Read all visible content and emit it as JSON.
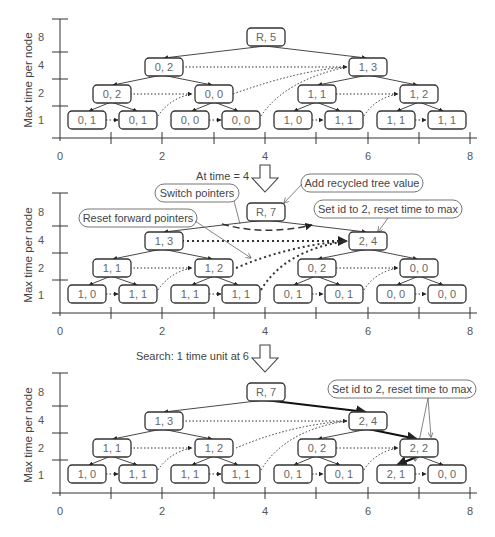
{
  "panels": [
    {
      "id": "panel-1",
      "axis": {
        "ylabel": "Max time per node",
        "yticks": [
          "1",
          "2",
          "4",
          "8"
        ],
        "xticks": [
          "0",
          "2",
          "4",
          "6",
          "8"
        ]
      },
      "nodes": {
        "root": "R, 5",
        "l2": [
          "0, 2",
          "1, 3"
        ],
        "l1": [
          "0, 2",
          "0, 0",
          "1, 1",
          "1, 2"
        ],
        "l0": [
          "0, 1",
          "0, 1",
          "0, 0",
          "0, 0",
          "1, 0",
          "1, 1",
          "1, 1",
          "1, 1"
        ]
      }
    },
    {
      "id": "panel-2",
      "caption": "At time = 4",
      "callouts": {
        "switch": "Switch pointers",
        "reset_forward": "Reset forward pointers",
        "add_recycled": "Add recycled tree value",
        "set_id": "Set id to 2, reset time to max"
      },
      "axis": {
        "ylabel": "Max time per node",
        "yticks": [
          "1",
          "2",
          "4",
          "8"
        ],
        "xticks": [
          "0",
          "2",
          "4",
          "6",
          "8"
        ]
      },
      "nodes": {
        "root": "R, 7",
        "l2": [
          "1, 3",
          "2, 4"
        ],
        "l1": [
          "1, 1",
          "1, 2",
          "0, 2",
          "0, 0"
        ],
        "l0": [
          "1, 0",
          "1, 1",
          "1, 1",
          "1, 1",
          "0, 1",
          "0, 1",
          "0, 0",
          "0, 0"
        ]
      }
    },
    {
      "id": "panel-3",
      "caption": "Search: 1 time unit at 6",
      "callouts": {
        "set_id": "Set id to 2, reset time to max"
      },
      "axis": {
        "ylabel": "Max time per node",
        "yticks": [
          "1",
          "2",
          "4",
          "8"
        ],
        "xticks": [
          "0",
          "2",
          "4",
          "6",
          "8"
        ]
      },
      "nodes": {
        "root": "R, 7",
        "l2": [
          "1, 3",
          "2, 4"
        ],
        "l1": [
          "1, 1",
          "1, 2",
          "0, 2",
          "2, 2"
        ],
        "l0": [
          "1, 0",
          "1, 1",
          "1, 1",
          "1, 1",
          "0, 1",
          "0, 1",
          "2, 1",
          "0, 0"
        ]
      }
    }
  ]
}
